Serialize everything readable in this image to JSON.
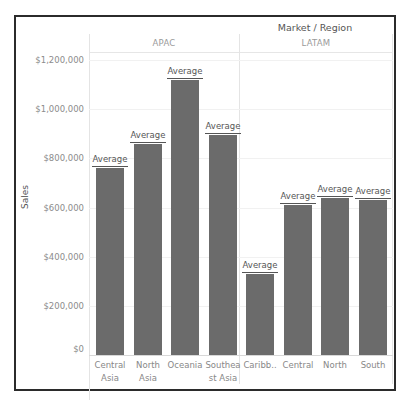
{
  "chart_data": {
    "type": "bar",
    "title": "Market / Region",
    "xlabel": "",
    "ylabel": "Sales",
    "ylim": [
      0,
      1200000
    ],
    "yticks": [
      "$0",
      "$200,000",
      "$400,000",
      "$600,000",
      "$800,000",
      "$1,000,000",
      "$1,200,000"
    ],
    "ytick_values": [
      0,
      200000,
      400000,
      600000,
      800000,
      1000000,
      1200000
    ],
    "grid": true,
    "legend": null,
    "reference_line_label": "Average",
    "panes": [
      {
        "market": "APAC",
        "categories": [
          "Central Asia",
          "North Asia",
          "Oceania",
          "Southeast Asia"
        ],
        "category_display": [
          "Central Asia",
          "North Asia",
          "Oceania",
          "Southea st Asia"
        ],
        "values": [
          760000,
          859000,
          1118000,
          896000
        ]
      },
      {
        "market": "LATAM",
        "categories": [
          "Caribbean",
          "Central",
          "North",
          "South"
        ],
        "category_display": [
          "Caribb..",
          "Central",
          "North",
          "South"
        ],
        "values": [
          329000,
          612000,
          637000,
          629000
        ]
      }
    ],
    "bar_color": "#6b6b6b"
  },
  "labels": {
    "title": "Market / Region",
    "yaxis_title": "Sales",
    "apac": "APAC",
    "latam": "LATAM",
    "average": "Average",
    "yticks": [
      "$0",
      "$200,000",
      "$400,000",
      "$600,000",
      "$800,000",
      "$1,000,000",
      "$1,200,000"
    ],
    "x": [
      "Central Asia",
      "North Asia",
      "Oceania",
      "Southea st Asia",
      "Caribb..",
      "Central",
      "North",
      "South"
    ]
  }
}
